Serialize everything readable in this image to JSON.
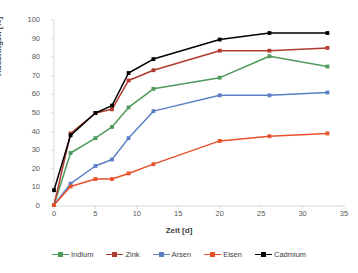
{
  "chart_data": {
    "type": "line",
    "title": "",
    "xlabel": "Zeit [d]",
    "ylabel": "Ausbringen [%]",
    "xlim": [
      0,
      35
    ],
    "ylim": [
      0,
      100
    ],
    "xticks": [
      0,
      5,
      10,
      15,
      20,
      25,
      30,
      35
    ],
    "yticks": [
      0,
      10,
      20,
      30,
      40,
      50,
      60,
      70,
      80,
      90,
      100
    ],
    "grid": false,
    "legend_position": "bottom",
    "x": [
      0,
      2,
      5,
      7,
      9,
      12,
      20,
      26,
      33
    ],
    "series": [
      {
        "name": "Indium",
        "color": "#4E9A5B",
        "marker": "square",
        "values": [
          0.5,
          28.5,
          36.5,
          42.5,
          53,
          63,
          69,
          80.5,
          75
        ]
      },
      {
        "name": "Zink",
        "color": "#B03A2E",
        "marker": "square",
        "values": [
          0.5,
          39,
          50,
          52,
          67.5,
          73,
          83.5,
          83.5,
          85
        ]
      },
      {
        "name": "Arsen",
        "color": "#5B7FC4",
        "marker": "square",
        "values": [
          0.5,
          12,
          21.5,
          25,
          36.5,
          51,
          59.5,
          59.5,
          61
        ]
      },
      {
        "name": "Eisen",
        "color": "#E8512A",
        "marker": "square",
        "values": [
          0.5,
          10.5,
          14.5,
          14.5,
          17.5,
          22.5,
          35,
          37.5,
          39
        ]
      },
      {
        "name": "Cadmium",
        "color": "#000000",
        "marker": "square",
        "values": [
          8.5,
          38,
          50,
          54,
          71.5,
          79,
          89.5,
          93,
          93
        ]
      }
    ]
  },
  "axis": {
    "y_tick_labels": [
      "0",
      "10",
      "20",
      "30",
      "40",
      "50",
      "60",
      "70",
      "80",
      "90",
      "100"
    ],
    "x_tick_labels": [
      "0",
      "5",
      "10",
      "15",
      "20",
      "25",
      "30",
      "35"
    ],
    "y_title": "Ausbringen [%]",
    "x_title": "Zeit [d]"
  },
  "legend": {
    "items": [
      {
        "label": "Indium",
        "color": "#4E9A5B"
      },
      {
        "label": "Zink",
        "color": "#B03A2E"
      },
      {
        "label": "Arsen",
        "color": "#5B7FC4"
      },
      {
        "label": "Eisen",
        "color": "#E8512A"
      },
      {
        "label": "Cadmium",
        "color": "#000000"
      }
    ]
  }
}
